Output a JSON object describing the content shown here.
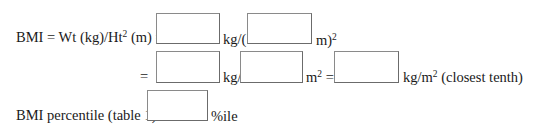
{
  "row1": {
    "lhs_prefix": "BMI = Wt (kg)/Ht",
    "lhs_sup": "2",
    "lhs_suffix": " (m) =",
    "unit_after_box1": "kg/(",
    "unit_after_box2": "m)",
    "unit_after_box2_sup": "2"
  },
  "row2": {
    "equals": "=",
    "unit_after_box3": "kg/",
    "unit_after_box4": "m",
    "unit_after_box4_sup": "2",
    "equals2": " =",
    "unit_after_box5": "kg/m",
    "unit_after_box5_sup": "2",
    "note": " (closest tenth)"
  },
  "row3": {
    "label": "BMI percentile (table 1)",
    "unit_after_box6": "%ile"
  },
  "fields": {
    "weight_kg": "",
    "height_m": "",
    "weight_kg_2": "",
    "height_m_squared": "",
    "bmi_result": "",
    "bmi_percentile": ""
  }
}
